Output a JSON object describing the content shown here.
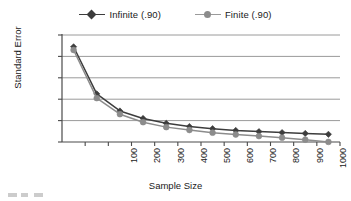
{
  "chart": {
    "type": "line",
    "xlabel": "Sample Size",
    "ylabel": "Standard Error",
    "title": ""
  },
  "legend": {
    "position": "top-center",
    "entries": [
      {
        "label": "Infinite (.90)",
        "color": "#3d3d3d",
        "marker": "diamond",
        "name": "legend-item-infinite"
      },
      {
        "label": "Finite (.90)",
        "color": "#8c8c8c",
        "marker": "circle",
        "name": "legend-item-finite"
      }
    ]
  },
  "axes": {
    "y": {
      "ticks": [
        "0.001",
        "0.0008",
        "0.0006",
        "0.0004",
        "0.0002",
        "0"
      ],
      "min": 0,
      "max": 0.001,
      "grid": true
    },
    "x": {
      "ticks": [
        "100",
        "200",
        "300",
        "400",
        "500",
        "600",
        "700",
        "800",
        "900",
        "1000",
        "1100",
        "1200"
      ],
      "min": 0,
      "max": 1200,
      "grid": false
    }
  },
  "colors": {
    "infinite": "#3d3d3d",
    "finite": "#8c8c8c",
    "gridline": "#9a9a9a",
    "axis": "#4a4a4a",
    "background": "#ffffff"
  },
  "chart_data": {
    "type": "line",
    "title": "",
    "xlabel": "Sample Size",
    "ylabel": "Standard Error",
    "xlim": [
      0,
      1200
    ],
    "ylim": [
      0,
      0.001
    ],
    "grid": true,
    "legend_position": "top-center",
    "x": [
      50,
      150,
      250,
      350,
      450,
      550,
      650,
      750,
      850,
      950,
      1050,
      1150
    ],
    "xtick_labels": [
      "100",
      "200",
      "300",
      "400",
      "500",
      "600",
      "700",
      "800",
      "900",
      "1000",
      "1100",
      "1200"
    ],
    "ytick_labels": [
      "0",
      "0.0002",
      "0.0004",
      "0.0006",
      "0.0008",
      "0.001"
    ],
    "series": [
      {
        "name": "Infinite (.90)",
        "marker": "diamond",
        "color": "#3d3d3d",
        "values": [
          0.00089,
          0.00045,
          0.00029,
          0.00022,
          0.000175,
          0.000145,
          0.000125,
          0.000108,
          9.7e-05,
          8.8e-05,
          8e-05,
          7.2e-05
        ]
      },
      {
        "name": "Finite (.90)",
        "marker": "circle",
        "color": "#8c8c8c",
        "values": [
          0.00086,
          0.00041,
          0.00026,
          0.000185,
          0.000139,
          0.000112,
          8.7e-05,
          7e-05,
          5.5e-05,
          4e-05,
          2.2e-05,
          1e-06
        ]
      }
    ]
  }
}
